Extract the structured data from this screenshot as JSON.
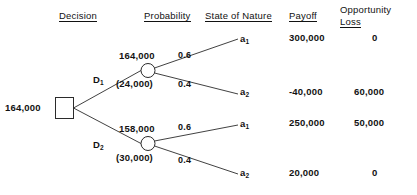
{
  "headers": {
    "decision": "Decision",
    "probability": "Probability",
    "state_of_nature": "State of Nature",
    "payoff": "Payoff",
    "opportunity_loss_line1": "Opportunity",
    "opportunity_loss_line2": "Loss"
  },
  "root": {
    "value": "164,000"
  },
  "branches": [
    {
      "decision_label": "D",
      "decision_sub": "1",
      "ev_value": "164,000",
      "regret_value": "(24,000)",
      "outcomes": [
        {
          "probability": "0.6",
          "state": "a",
          "state_sub": "1",
          "payoff": "300,000",
          "opportunity_loss": "0"
        },
        {
          "probability": "0.4",
          "state": "a",
          "state_sub": "2",
          "payoff": "-40,000",
          "opportunity_loss": "60,000"
        }
      ]
    },
    {
      "decision_label": "D",
      "decision_sub": "2",
      "ev_value": "158,000",
      "regret_value": "(30,000)",
      "outcomes": [
        {
          "probability": "0.6",
          "state": "a",
          "state_sub": "1",
          "payoff": "250,000",
          "opportunity_loss": "50,000"
        },
        {
          "probability": "0.4",
          "state": "a",
          "state_sub": "2",
          "payoff": "20,000",
          "opportunity_loss": "0"
        }
      ]
    }
  ],
  "colors": {
    "line": "#2b2b2b",
    "text": "#121212",
    "background": "#ffffff"
  }
}
